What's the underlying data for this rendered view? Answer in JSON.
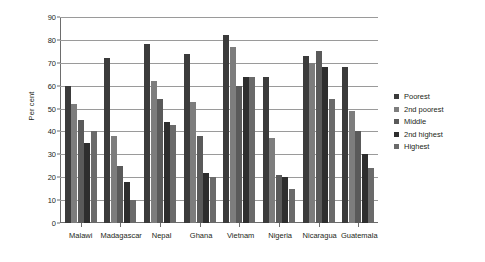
{
  "chart_data": {
    "type": "bar",
    "title": "",
    "subtitle": "",
    "xlabel": "",
    "ylabel": "Per cent",
    "ylim": [
      0,
      90
    ],
    "yticks": [
      0,
      10,
      20,
      30,
      40,
      50,
      60,
      70,
      80,
      90
    ],
    "grid": true,
    "legend_position": "right",
    "categories": [
      "Malawi",
      "Madagascar",
      "Nepal",
      "Ghana",
      "Vietnam",
      "Nigeria",
      "Nicaragua",
      "Guatemala"
    ],
    "series": [
      {
        "name": "Poorest",
        "color": "#3b3b3b",
        "values": [
          60,
          72,
          78,
          74,
          82,
          64,
          73,
          68
        ]
      },
      {
        "name": "2nd poorest",
        "color": "#7d7d7d",
        "values": [
          52,
          38,
          62,
          53,
          77,
          37,
          70,
          49
        ]
      },
      {
        "name": "Middle",
        "color": "#5a5a5a",
        "values": [
          45,
          25,
          54,
          38,
          60,
          21,
          75,
          40
        ]
      },
      {
        "name": "2nd highest",
        "color": "#2e2e2e",
        "values": [
          35,
          18,
          44,
          22,
          64,
          20,
          68,
          30
        ]
      },
      {
        "name": "Highest",
        "color": "#6a6a6a",
        "values": [
          40,
          10,
          43,
          20,
          64,
          15,
          54,
          24
        ]
      }
    ]
  },
  "axis": {
    "y_label": "Per cent"
  }
}
